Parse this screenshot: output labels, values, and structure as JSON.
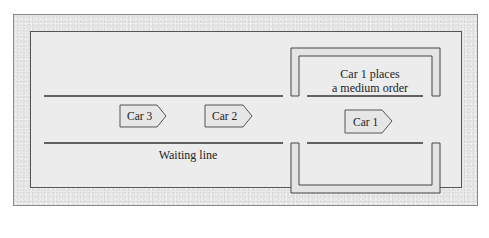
{
  "diagram": {
    "window_caption_line1": "Car 1 places",
    "window_caption_line2": "a medium order",
    "waiting_line_label": "Waiting line",
    "cars": [
      {
        "label": "Car 3",
        "position": "third in line"
      },
      {
        "label": "Car 2",
        "position": "second in line"
      },
      {
        "label": "Car 1",
        "position": "at ordering window"
      }
    ],
    "colors": {
      "frame_fill": "#e9e9e9",
      "panel_fill": "#ececec",
      "line_color": "#333333",
      "car_fill": "#e6e6e6"
    }
  }
}
